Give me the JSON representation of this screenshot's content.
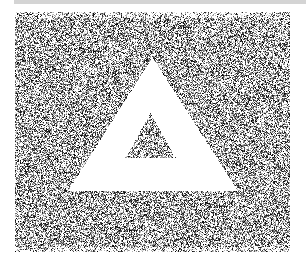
{
  "image": {
    "description": "Stippled noise texture with a white triangle outline revealing a noise-filled inner triangle",
    "colors": {
      "background": "#ffffff",
      "top_bar": "#d4d4d4",
      "dots": "#222222"
    },
    "noise_region": {
      "x": 15,
      "y": 12,
      "width": 275,
      "height": 240
    },
    "outer_triangle": {
      "apex": [
        152,
        57
      ],
      "left": [
        68,
        190
      ],
      "right": [
        237,
        190
      ]
    },
    "inner_triangle": {
      "apex": [
        150,
        113
      ],
      "left": [
        125,
        157
      ],
      "right": [
        175,
        157
      ]
    },
    "caption": "Triangle noise image"
  }
}
